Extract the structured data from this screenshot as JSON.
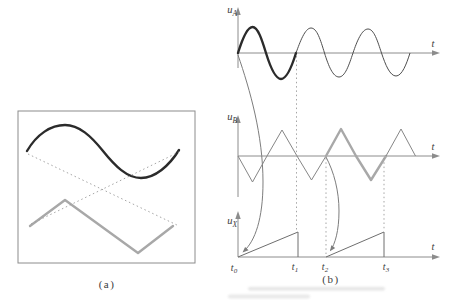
{
  "panel_a": {
    "caption": "(a)"
  },
  "panel_b": {
    "caption": "(b)",
    "plots": [
      {
        "id": "uA",
        "y_base": "u",
        "y_sub": "A",
        "t_label": "t"
      },
      {
        "id": "uB",
        "y_base": "u",
        "y_sub": "B",
        "t_label": "t"
      },
      {
        "id": "uX",
        "y_base": "u",
        "y_sub": "X",
        "t_label": "t"
      }
    ],
    "time_marks": [
      {
        "base": "t",
        "sub": "0"
      },
      {
        "base": "t",
        "sub": "1"
      },
      {
        "base": "t",
        "sub": "2"
      },
      {
        "base": "t",
        "sub": "3"
      }
    ]
  },
  "waveforms": {
    "u_A": {
      "shape": "sine",
      "cycles_shown": 3,
      "highlighted_cycle_interval": [
        "t0",
        "t1"
      ]
    },
    "u_B": {
      "shape": "triangle",
      "cycles_shown": 3,
      "highlighted_cycle_interval": [
        "t2",
        "t3"
      ]
    },
    "u_X": {
      "shape": "sawtooth-sweep",
      "ramp_intervals": [
        [
          "t0",
          "t1"
        ],
        [
          "t2",
          "t3"
        ]
      ]
    },
    "panel_a_screen": {
      "dark_curve": "sine cycle",
      "gray_curve": "triangle cycle",
      "dotted": "retrace lines crossing between curve ends"
    }
  },
  "colors": {
    "bg": "#ffffff",
    "axis": "#8c8c8c",
    "box": "#8c8c8c",
    "dark_wave": "#2b2b2b",
    "dark_wave_thin": "#4f4f4f",
    "gray_wave": "#a8a8a8",
    "gray_wave_thin": "#868686",
    "ramp": "#6e6e6e",
    "dotted": "#9b9b9b",
    "sweep": "#7d7d7d",
    "label": "#3b3b3b",
    "blur": "#cfcfcf"
  }
}
